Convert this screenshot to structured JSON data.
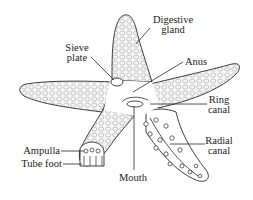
{
  "diagram": {
    "colors": {
      "line": "#2a2a2a",
      "body_fill": "#f4f4f4",
      "texture": "#9a9a9a",
      "background": "#ffffff"
    },
    "labels": [
      {
        "id": "digestive-gland",
        "lines": [
          "Digestive",
          "gland"
        ]
      },
      {
        "id": "sieve-plate",
        "lines": [
          "Sieve",
          "plate"
        ]
      },
      {
        "id": "anus",
        "lines": [
          "Anus"
        ]
      },
      {
        "id": "ring-canal",
        "lines": [
          "Ring",
          "canal"
        ]
      },
      {
        "id": "radial-canal",
        "lines": [
          "Radial",
          "canal"
        ]
      },
      {
        "id": "ampulla",
        "lines": [
          "Ampulla"
        ]
      },
      {
        "id": "tube-foot",
        "lines": [
          "Tube foot"
        ]
      },
      {
        "id": "mouth",
        "lines": [
          "Mouth"
        ]
      }
    ]
  }
}
